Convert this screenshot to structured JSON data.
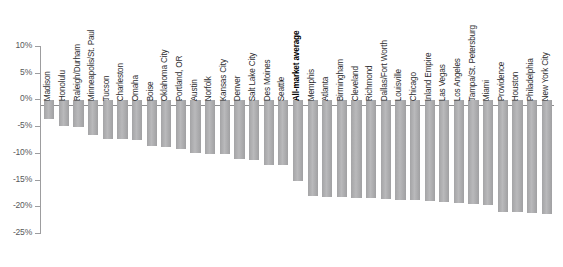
{
  "chart_data": {
    "type": "bar",
    "title": "",
    "subtitle": "",
    "xlabel": "",
    "ylabel": "",
    "ylim": [
      -25,
      10
    ],
    "y_ticks": [
      10,
      5,
      0,
      -5,
      -10,
      -15,
      -20,
      -25
    ],
    "y_tick_labels": [
      "10%",
      "5%",
      "0%",
      "-5%",
      "-10%",
      "-15%",
      "-20%",
      "-25%"
    ],
    "grid": false,
    "legend": "none",
    "orientation": "vertical",
    "bar_color": "#adadaf",
    "baseline": 0,
    "highlight_category": "All-market average",
    "categories": [
      "Madison",
      "Honolulu",
      "Raleigh/Durham",
      "Minneapolis/St. Paul",
      "Tucson",
      "Charleston",
      "Omaha",
      "Boise",
      "Oklahoma City",
      "Portland, OR",
      "Austin",
      "Norfolk",
      "Kansas City",
      "Denver",
      "Salt Lake City",
      "Des Moines",
      "Seattle",
      "All-market average",
      "Memphis",
      "Atlanta",
      "Birmingham",
      "Cleveland",
      "Richmond",
      "Dallas/Fort Worth",
      "Louisville",
      "Chicago",
      "Inland Empire",
      "Las Vegas",
      "Los Angeles",
      "Tampa/St. Petersburg",
      "Miami",
      "Providence",
      "Houston",
      "Philadelphia",
      "New York City"
    ],
    "values": [
      -3.5,
      -4.8,
      -4.9,
      -6.5,
      -7.2,
      -7.3,
      -7.4,
      -8.6,
      -8.8,
      -9.0,
      -9.8,
      -10.0,
      -10.1,
      -11.0,
      -11.2,
      -12.0,
      -12.1,
      -15.0,
      -17.9,
      -18.0,
      -18.1,
      -18.2,
      -18.3,
      -18.4,
      -18.6,
      -18.7,
      -18.8,
      -19.0,
      -19.2,
      -19.4,
      -19.6,
      -20.8,
      -20.9,
      -21.0,
      -21.2
    ]
  }
}
